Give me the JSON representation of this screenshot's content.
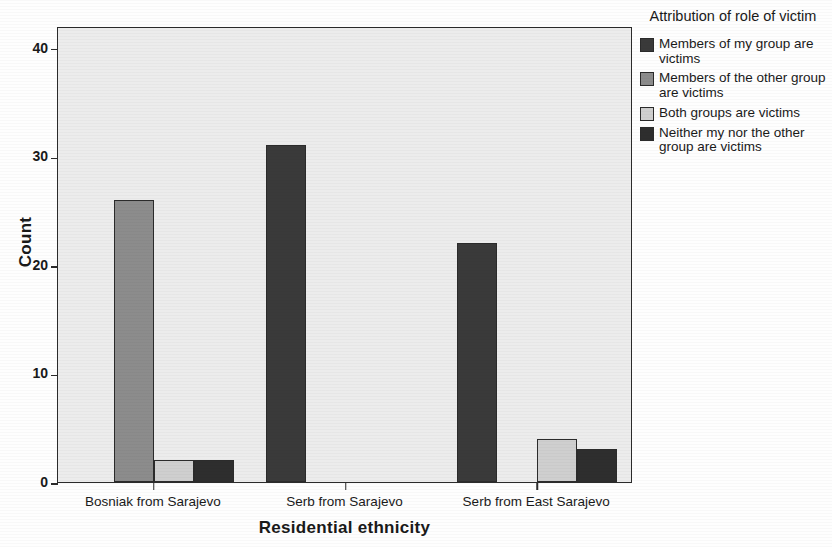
{
  "chart_data": {
    "type": "bar",
    "title": "",
    "xlabel": "Residential ethnicity",
    "ylabel": "Count",
    "categories": [
      "Bosniak from Sarajevo",
      "Serb from Sarajevo",
      "Serb from East Sarajevo"
    ],
    "series": [
      {
        "name": "Members of my group are victims",
        "color": "#3a3a3a",
        "values": [
          0,
          31,
          22
        ]
      },
      {
        "name": "Members of the other group are victims",
        "color": "#8c8c8c",
        "values": [
          26,
          0,
          0
        ]
      },
      {
        "name": "Both groups are victims",
        "color": "#cfcfcf",
        "values": [
          2,
          0,
          4
        ]
      },
      {
        "name": "Neither my nor the other group are victims",
        "color": "#2e2e2e",
        "values": [
          2,
          0,
          3
        ]
      }
    ],
    "ylim": [
      0,
      42
    ],
    "yticks": [
      0,
      10,
      20,
      30,
      40
    ],
    "ytick_labels": [
      "0",
      "10",
      "20",
      "30",
      "40"
    ],
    "grid": false,
    "legend_position": "right",
    "legend_title": "Attribution of role of victim",
    "plot_background": "#ececec",
    "axis_color": "#2b2b2b"
  },
  "legend": {
    "title": "Attribution of role of victim",
    "entries": [
      {
        "label": "Members of my group are victims",
        "color": "#3a3a3a"
      },
      {
        "label": "Members of the other group are victims",
        "color": "#8c8c8c"
      },
      {
        "label": "Both groups are victims",
        "color": "#cfcfcf"
      },
      {
        "label": "Neither my nor the other group are victims",
        "color": "#2e2e2e"
      }
    ]
  }
}
